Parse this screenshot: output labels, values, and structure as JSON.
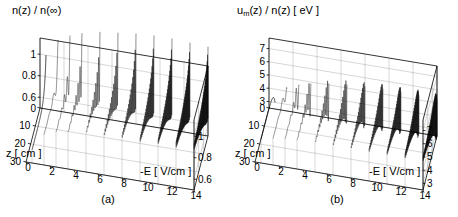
{
  "figure": {
    "panels": [
      {
        "id": "a",
        "label": "(a)",
        "zaxis_title_main": "n(z) / n(",
        "zaxis_title_inf": "∞",
        "zaxis_title_close": ")",
        "zaxis_title_full": "n(z) / n(∞)",
        "left_ticks": [
          "1",
          "0.8",
          "0.6"
        ],
        "right_ticks": [
          "1",
          "0.8",
          "0.6"
        ],
        "origin_tick": "0",
        "depth_axis_name": "z [ cm ]",
        "depth_ticks": [
          "0",
          "10",
          "20",
          "30"
        ],
        "field_axis_name": "-E  [ V/cm ]",
        "field_ticks": [
          "0",
          "2",
          "4",
          "6",
          "8",
          "10",
          "12",
          "14"
        ]
      },
      {
        "id": "b",
        "label": "(b)",
        "zaxis_title_main": "u",
        "zaxis_title_sub": "m",
        "zaxis_title_rest": "(z) / n(z)  [ eV ]",
        "zaxis_title_full": "um(z) / n(z)  [ eV ]",
        "left_ticks": [
          "7",
          "6",
          "5",
          "4",
          "3"
        ],
        "right_ticks": [
          "7",
          "6",
          "5",
          "4",
          "3"
        ],
        "origin_tick": "0",
        "depth_axis_name": "z [ cm ]",
        "depth_ticks": [
          "0",
          "10",
          "20",
          "30"
        ],
        "field_axis_name": "-E  [ V/cm ]",
        "field_ticks": [
          "0",
          "2",
          "4",
          "6",
          "8",
          "10",
          "12",
          "14"
        ]
      }
    ]
  },
  "chart_data": [
    {
      "type": "line",
      "title": "n(z) / n(∞)",
      "projection": "3d-waterfall",
      "xlabel": "-E  [ V/cm ]",
      "ylabel": "z [ cm ]",
      "zlabel": "n(z) / n(∞)",
      "xlim": [
        0,
        14
      ],
      "ylim": [
        0,
        30
      ],
      "zlim": [
        0.5,
        1.15
      ],
      "xticks": [
        0,
        2,
        4,
        6,
        8,
        10,
        12,
        14
      ],
      "yticks": [
        0,
        10,
        20,
        30
      ],
      "zticks": [
        0.6,
        0.8,
        1.0
      ],
      "grid": true,
      "legend": false,
      "annotation": "(a)",
      "description": "Waterfall of normalised electron density profiles n(z)/n(inf) versus depth z for a sequence of reduced field strengths -E. The front (low field) trace decays monotonically from 1 toward about 0.6; with increasing field the profiles develop damped spatial oscillations whose frequency grows and whose amplitude decays with z.",
      "series": [
        {
          "name": "-E = 0.5",
          "E": 0.5,
          "osc_cycles": 0.0,
          "amp": 0.0,
          "decay": 0.1,
          "baseline": 0.62,
          "start": 1.0
        },
        {
          "name": "-E = 1.5",
          "E": 1.5,
          "osc_cycles": 3.0,
          "amp": 0.16,
          "decay": 0.16,
          "baseline": 0.78,
          "start": 1.0
        },
        {
          "name": "-E = 2.5",
          "E": 2.5,
          "osc_cycles": 5.0,
          "amp": 0.22,
          "decay": 0.13,
          "baseline": 0.82,
          "start": 1.0
        },
        {
          "name": "-E = 3.5",
          "E": 3.5,
          "osc_cycles": 7.0,
          "amp": 0.26,
          "decay": 0.12,
          "baseline": 0.84,
          "start": 1.0
        },
        {
          "name": "-E = 5.0",
          "E": 5.0,
          "osc_cycles": 10.0,
          "amp": 0.3,
          "decay": 0.11,
          "baseline": 0.86,
          "start": 1.0
        },
        {
          "name": "-E = 6.5",
          "E": 6.5,
          "osc_cycles": 13.0,
          "amp": 0.32,
          "decay": 0.1,
          "baseline": 0.87,
          "start": 1.0
        },
        {
          "name": "-E = 8.0",
          "E": 8.0,
          "osc_cycles": 17.0,
          "amp": 0.34,
          "decay": 0.1,
          "baseline": 0.88,
          "start": 1.0
        },
        {
          "name": "-E = 9.5",
          "E": 9.5,
          "osc_cycles": 21.0,
          "amp": 0.35,
          "decay": 0.09,
          "baseline": 0.88,
          "start": 1.0
        },
        {
          "name": "-E = 11.0",
          "E": 11.0,
          "osc_cycles": 25.0,
          "amp": 0.35,
          "decay": 0.09,
          "baseline": 0.89,
          "start": 1.0
        },
        {
          "name": "-E = 12.5",
          "E": 12.5,
          "osc_cycles": 29.0,
          "amp": 0.34,
          "decay": 0.08,
          "baseline": 0.89,
          "start": 1.0
        },
        {
          "name": "-E = 14.0",
          "E": 14.0,
          "osc_cycles": 33.0,
          "amp": 0.33,
          "decay": 0.08,
          "baseline": 0.9,
          "start": 1.0
        }
      ]
    },
    {
      "type": "line",
      "title": "um(z) / n(z)  [ eV ]",
      "projection": "3d-waterfall",
      "xlabel": "-E  [ V/cm ]",
      "ylabel": "z [ cm ]",
      "zlabel": "um(z) / n(z)  [ eV ]",
      "xlim": [
        0,
        14
      ],
      "ylim": [
        0,
        30
      ],
      "zlim": [
        2.5,
        7.8
      ],
      "xticks": [
        0,
        2,
        4,
        6,
        8,
        10,
        12,
        14
      ],
      "yticks": [
        0,
        10,
        20,
        30
      ],
      "zticks": [
        3,
        4,
        5,
        6,
        7
      ],
      "grid": true,
      "legend": false,
      "annotation": "(b)",
      "description": "Waterfall of mean energy per electron um(z)/n(z) in eV versus depth z for the same sequence of reduced field strengths. The front trace rises from about 3 eV with a rounded shoulder to a plateau near 4.3 eV; higher fields produce damped oscillations about the plateau with increasing spatial frequency.",
      "series": [
        {
          "name": "-E = 0.5",
          "E": 0.5,
          "osc_cycles": 0.0,
          "amp": 0.0,
          "decay": 0.1,
          "baseline": 4.3,
          "start": 3.0
        },
        {
          "name": "-E = 1.5",
          "E": 1.5,
          "osc_cycles": 3.0,
          "amp": 1.1,
          "decay": 0.16,
          "baseline": 4.5,
          "start": 3.1
        },
        {
          "name": "-E = 2.5",
          "E": 2.5,
          "osc_cycles": 5.0,
          "amp": 1.5,
          "decay": 0.13,
          "baseline": 4.6,
          "start": 3.1
        },
        {
          "name": "-E = 3.5",
          "E": 3.5,
          "osc_cycles": 7.0,
          "amp": 1.75,
          "decay": 0.12,
          "baseline": 4.65,
          "start": 3.1
        },
        {
          "name": "-E = 5.0",
          "E": 5.0,
          "osc_cycles": 10.0,
          "amp": 2.0,
          "decay": 0.11,
          "baseline": 4.7,
          "start": 3.1
        },
        {
          "name": "-E = 6.5",
          "E": 6.5,
          "osc_cycles": 13.0,
          "amp": 2.15,
          "decay": 0.1,
          "baseline": 4.75,
          "start": 3.1
        },
        {
          "name": "-E = 8.0",
          "E": 8.0,
          "osc_cycles": 17.0,
          "amp": 2.25,
          "decay": 0.1,
          "baseline": 4.78,
          "start": 3.1
        },
        {
          "name": "-E = 9.5",
          "E": 9.5,
          "osc_cycles": 21.0,
          "amp": 2.3,
          "decay": 0.09,
          "baseline": 4.8,
          "start": 3.1
        },
        {
          "name": "-E = 11.0",
          "E": 11.0,
          "osc_cycles": 25.0,
          "amp": 2.3,
          "decay": 0.09,
          "baseline": 4.82,
          "start": 3.1
        },
        {
          "name": "-E = 12.5",
          "E": 12.5,
          "osc_cycles": 29.0,
          "amp": 2.25,
          "decay": 0.08,
          "baseline": 4.84,
          "start": 3.1
        },
        {
          "name": "-E = 14.0",
          "E": 14.0,
          "osc_cycles": 33.0,
          "amp": 2.2,
          "decay": 0.08,
          "baseline": 4.85,
          "start": 3.1
        }
      ]
    }
  ]
}
